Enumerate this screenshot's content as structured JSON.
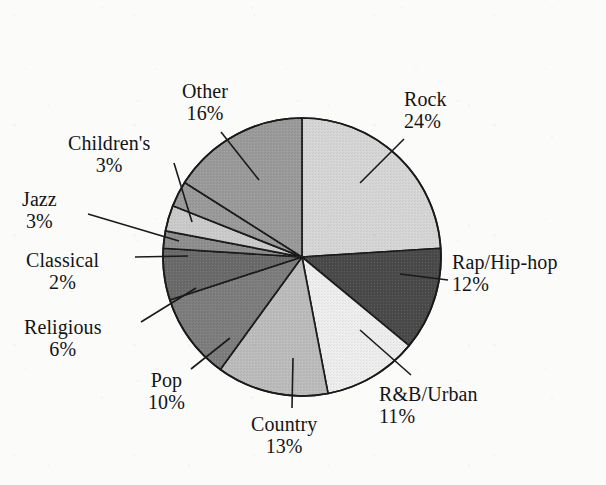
{
  "figure": {
    "kind": "pie-chart",
    "background_color": "#fbfbfa",
    "outline_color": "#1a1a1a",
    "center_x": 302,
    "center_y": 257,
    "radius": 139,
    "start_angle_deg": -90,
    "direction": "clockwise"
  },
  "chart_data": {
    "type": "pie",
    "title": "",
    "xlabel": "",
    "ylabel": "",
    "units": "percent",
    "total": 100,
    "legend": "none (direct labels with leader lines)",
    "grid": false,
    "categories": [
      "Rock",
      "Rap/Hip-hop",
      "R&B/Urban",
      "Country",
      "Pop",
      "Religious",
      "Classical",
      "Jazz",
      "Children's",
      "Other"
    ],
    "values": [
      24,
      12,
      11,
      13,
      10,
      6,
      2,
      3,
      3,
      16
    ],
    "labels": [
      "24%",
      "12%",
      "11%",
      "13%",
      "10%",
      "6%",
      "2%",
      "3%",
      "3%",
      "16%"
    ],
    "colors": [
      "#d6d6d6",
      "#4a4a4a",
      "#eeeeee",
      "#bcbcbc",
      "#7d7d7d",
      "#6a6a6a",
      "#8e8e8e",
      "#cbcbcb",
      "#9a9a9a",
      "#9a9a9a"
    ],
    "slices": [
      {
        "name": "Rock",
        "value": 24,
        "label": "24%",
        "color": "#d6d6d6",
        "start_deg": -90.0,
        "end_deg": -3.6
      },
      {
        "name": "Rap/Hip-hop",
        "value": 12,
        "label": "12%",
        "color": "#4a4a4a",
        "start_deg": -3.6,
        "end_deg": 39.6
      },
      {
        "name": "R&B/Urban",
        "value": 11,
        "label": "11%",
        "color": "#eeeeee",
        "start_deg": 39.6,
        "end_deg": 79.2
      },
      {
        "name": "Country",
        "value": 13,
        "label": "13%",
        "color": "#bcbcbc",
        "start_deg": 79.2,
        "end_deg": 126.0
      },
      {
        "name": "Pop",
        "value": 10,
        "label": "10%",
        "color": "#7d7d7d",
        "start_deg": 126.0,
        "end_deg": 162.0
      },
      {
        "name": "Religious",
        "value": 6,
        "label": "6%",
        "color": "#6a6a6a",
        "start_deg": 162.0,
        "end_deg": 183.6
      },
      {
        "name": "Classical",
        "value": 2,
        "label": "2%",
        "color": "#8e8e8e",
        "start_deg": 183.6,
        "end_deg": 190.8
      },
      {
        "name": "Jazz",
        "value": 3,
        "label": "3%",
        "color": "#cbcbcb",
        "start_deg": 190.8,
        "end_deg": 201.6
      },
      {
        "name": "Children's",
        "value": 3,
        "label": "3%",
        "color": "#9a9a9a",
        "start_deg": 201.6,
        "end_deg": 212.4
      },
      {
        "name": "Other",
        "value": 16,
        "label": "16%",
        "color": "#9a9a9a",
        "start_deg": 212.4,
        "end_deg": 270.0
      }
    ]
  },
  "callouts": [
    {
      "name": "Rock",
      "pct": "24%",
      "x": 404,
      "y": 88,
      "align": "left",
      "line": {
        "x1": 404,
        "y1": 139,
        "x2": 360,
        "y2": 183
      }
    },
    {
      "name": "Rap/Hip-hop",
      "pct": "12%",
      "x": 452,
      "y": 251,
      "align": "left",
      "line": {
        "x1": 448,
        "y1": 280,
        "x2": 400,
        "y2": 274
      }
    },
    {
      "name": "R&B/Urban",
      "pct": "11%",
      "x": 379,
      "y": 383,
      "align": "left",
      "line": {
        "x1": 411,
        "y1": 375,
        "x2": 360,
        "y2": 330
      }
    },
    {
      "name": "Country",
      "pct": "13%",
      "x": 251,
      "y": 413,
      "align": "center",
      "line": {
        "x1": 292,
        "y1": 408,
        "x2": 293,
        "y2": 358
      }
    },
    {
      "name": "Pop",
      "pct": "10%",
      "x": 148,
      "y": 369,
      "align": "center",
      "line": {
        "x1": 191,
        "y1": 369,
        "x2": 230,
        "y2": 338
      }
    },
    {
      "name": "Religious",
      "pct": "6%",
      "x": 24,
      "y": 316,
      "align": "center",
      "line": {
        "x1": 141,
        "y1": 322,
        "x2": 196,
        "y2": 288
      }
    },
    {
      "name": "Classical",
      "pct": "2%",
      "x": 26,
      "y": 249,
      "align": "center",
      "line": {
        "x1": 135,
        "y1": 257,
        "x2": 188,
        "y2": 256
      }
    },
    {
      "name": "Jazz",
      "pct": "3%",
      "x": 22,
      "y": 188,
      "align": "center",
      "line": {
        "x1": 88,
        "y1": 214,
        "x2": 179,
        "y2": 241
      }
    },
    {
      "name": "Children's",
      "pct": "3%",
      "x": 68,
      "y": 132,
      "align": "center",
      "line": {
        "x1": 174,
        "y1": 163,
        "x2": 192,
        "y2": 222
      }
    },
    {
      "name": "Other",
      "pct": "16%",
      "x": 182,
      "y": 80,
      "align": "center",
      "line": {
        "x1": 221,
        "y1": 132,
        "x2": 259,
        "y2": 180
      }
    }
  ]
}
